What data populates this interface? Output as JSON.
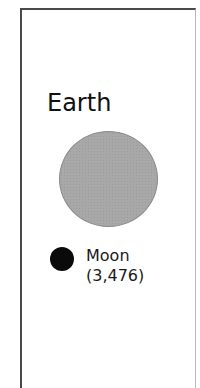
{
  "diagram": {
    "bodies": [
      {
        "name": "Earth",
        "label": "Earth",
        "color": "#a8a8a8",
        "shape": "circle",
        "relative_diameter_px": 99
      },
      {
        "name": "Moon",
        "label": "Moon",
        "value_label": "(3,476)",
        "color": "#0a0a0a",
        "shape": "circle",
        "relative_diameter_px": 24
      }
    ]
  }
}
